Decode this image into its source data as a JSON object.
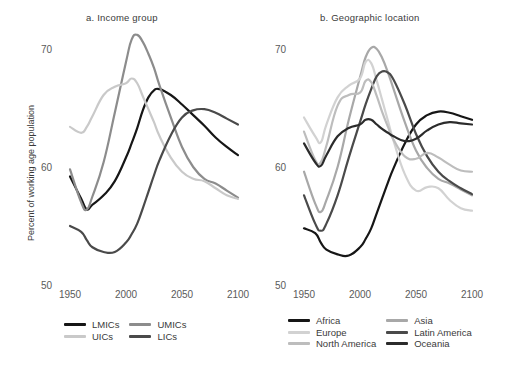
{
  "figure": {
    "ylabel": "Percent of working age population",
    "yticks": [
      "50",
      "60",
      "70"
    ],
    "xticks": [
      "1950",
      "2000",
      "2050",
      "2100"
    ]
  },
  "panel_a": {
    "title": "a. Income group",
    "legend": [
      {
        "label": "LMICs",
        "color": "#161616"
      },
      {
        "label": "UMICs",
        "color": "#8c8c8c"
      },
      {
        "label": "UICs",
        "color": "#c9c9c9"
      },
      {
        "label": "LICs",
        "color": "#4a4a4a"
      }
    ]
  },
  "panel_b": {
    "title": "b. Geographic location",
    "legend": [
      {
        "label": "Africa",
        "color": "#161616"
      },
      {
        "label": "Asia",
        "color": "#a8a8a8"
      },
      {
        "label": "Europe",
        "color": "#d2d2d2"
      },
      {
        "label": "Latin America",
        "color": "#4a4a4a"
      },
      {
        "label": "North America",
        "color": "#bdbdbd"
      },
      {
        "label": "Oceania",
        "color": "#2b2b2b"
      }
    ]
  },
  "chart_data": {
    "type": "line",
    "xlabel": "",
    "ylabel": "Percent of working age population",
    "xlim": [
      1950,
      2100
    ],
    "ylim": [
      50,
      72
    ],
    "yticks": [
      50,
      60,
      70
    ],
    "xticks": [
      1950,
      2000,
      2050,
      2100
    ],
    "grid": false,
    "legend_position": "below-panel",
    "panels": [
      {
        "key": "panel_a",
        "title": "a. Income group",
        "x": [
          1950,
          1960,
          1965,
          1970,
          1980,
          1990,
          2000,
          2005,
          2010,
          2015,
          2020,
          2025,
          2030,
          2040,
          2050,
          2060,
          2070,
          2080,
          2090,
          2100
        ],
        "series": [
          {
            "name": "LMICs",
            "color": "#161616",
            "values": [
              59.2,
              57.3,
              56.4,
              56.8,
              57.6,
              58.8,
              60.8,
              62.0,
              63.3,
              64.8,
              65.9,
              66.5,
              66.6,
              66.1,
              65.3,
              64.4,
              63.5,
              62.5,
              61.7,
              61.0
            ]
          },
          {
            "name": "UMICs",
            "color": "#8c8c8c",
            "values": [
              59.8,
              57.0,
              56.4,
              57.5,
              60.4,
              64.6,
              68.9,
              70.8,
              71.2,
              70.6,
              69.6,
              68.4,
              66.9,
              64.2,
              61.7,
              60.0,
              59.0,
              58.6,
              58.0,
              57.4
            ]
          },
          {
            "name": "UICs",
            "color": "#c9c9c9",
            "values": [
              63.4,
              62.9,
              63.4,
              64.3,
              66.1,
              66.8,
              67.1,
              67.5,
              67.1,
              66.0,
              64.9,
              63.8,
              62.6,
              60.8,
              59.6,
              59.0,
              58.8,
              58.2,
              57.6,
              57.3
            ]
          },
          {
            "name": "LICs",
            "color": "#4a4a4a",
            "values": [
              55.0,
              54.5,
              53.8,
              53.2,
              52.8,
              52.8,
              53.6,
              54.3,
              55.2,
              56.5,
              57.9,
              59.3,
              60.6,
              62.7,
              64.2,
              64.8,
              64.9,
              64.6,
              64.1,
              63.6
            ]
          }
        ]
      },
      {
        "key": "panel_b",
        "title": "b. Geographic location",
        "x": [
          1950,
          1960,
          1965,
          1970,
          1980,
          1990,
          2000,
          2005,
          2010,
          2015,
          2020,
          2025,
          2030,
          2040,
          2050,
          2060,
          2070,
          2080,
          2090,
          2100
        ],
        "series": [
          {
            "name": "Africa",
            "color": "#161616",
            "values": [
              54.8,
              54.4,
              53.6,
              53.0,
              52.6,
              52.5,
              53.2,
              53.9,
              54.8,
              56.1,
              57.4,
              58.7,
              59.9,
              62.0,
              63.6,
              64.4,
              64.7,
              64.6,
              64.3,
              64.0
            ]
          },
          {
            "name": "Asia",
            "color": "#a8a8a8",
            "values": [
              59.6,
              56.9,
              56.2,
              57.2,
              60.0,
              64.0,
              67.6,
              69.3,
              70.1,
              70.0,
              69.2,
              68.0,
              66.6,
              63.8,
              61.4,
              59.9,
              59.0,
              58.6,
              58.1,
              57.6
            ]
          },
          {
            "name": "Europe",
            "color": "#d2d2d2",
            "values": [
              64.2,
              62.6,
              62.1,
              63.6,
              65.9,
              66.9,
              67.5,
              68.9,
              68.8,
              67.3,
              65.6,
              63.9,
              62.2,
              59.4,
              58.0,
              58.3,
              58.2,
              57.2,
              56.5,
              56.3
            ]
          },
          {
            "name": "Latin America",
            "color": "#4a4a4a",
            "values": [
              57.6,
              55.2,
              54.6,
              55.2,
              57.6,
              60.8,
              63.8,
              65.3,
              66.6,
              67.7,
              68.1,
              68.0,
              67.4,
              65.3,
              62.8,
              60.9,
              59.6,
              58.8,
              58.2,
              57.7
            ]
          },
          {
            "name": "North America",
            "color": "#bdbdbd",
            "values": [
              63.0,
              60.6,
              60.4,
              61.8,
              65.2,
              66.1,
              66.3,
              67.3,
              67.2,
              66.0,
              64.6,
              63.4,
              62.3,
              60.9,
              60.7,
              61.2,
              60.8,
              60.2,
              59.7,
              59.6
            ]
          },
          {
            "name": "Oceania",
            "color": "#2b2b2b",
            "values": [
              62.0,
              60.4,
              60.1,
              61.0,
              62.6,
              63.3,
              63.6,
              64.0,
              64.0,
              63.6,
              63.2,
              62.9,
              62.6,
              62.2,
              62.4,
              63.1,
              63.6,
              63.8,
              63.7,
              63.6
            ]
          }
        ]
      }
    ]
  }
}
